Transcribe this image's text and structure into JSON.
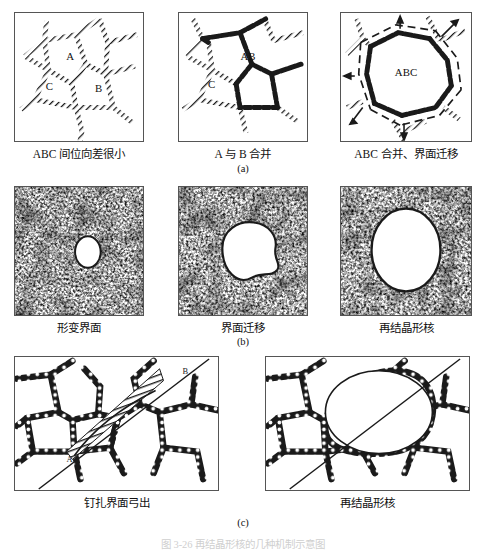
{
  "figure": {
    "bottom_caption": "图 3-26   再结晶形核的几种机制示意图",
    "rows": [
      {
        "id": "a",
        "row_label": "(a)",
        "mechanism": "亚晶合并形核",
        "panels": [
          {
            "caption": "ABC 间位向差很小",
            "grain_labels": [
              "A",
              "B",
              "C"
            ],
            "boundary_style": "hatched-thin",
            "description": "多边形亚晶网络，A、B、C 三个亚晶相邻"
          },
          {
            "caption": "A 与 B 合并",
            "grain_labels": [
              "AB",
              "C"
            ],
            "boundary_style": "hatched-thin-and-thick",
            "description": "A 与 B 之间亚晶界消失，合并为 AB，界面加粗"
          },
          {
            "caption": "ABC 合并、界面迁移",
            "grain_labels": [
              "ABC"
            ],
            "boundary_style": "thick-with-dashed-migration",
            "arrows": 5,
            "description": "ABC 合并为大晶粒，虚线表示迁移后界面位置，箭头表示迁移方向"
          }
        ]
      },
      {
        "id": "b",
        "row_label": "(b)",
        "mechanism": "变形基体中界面迁移形核",
        "panels": [
          {
            "caption": "形变界面",
            "boundary_style": "deformed-matrix",
            "nucleus_size": "small",
            "description": "高密度位错形变组织，出现很小的无畸变区"
          },
          {
            "caption": "界面迁移",
            "boundary_style": "deformed-matrix",
            "nucleus_size": "medium",
            "description": "无畸变区长大，界面向形变基体迁移"
          },
          {
            "caption": "再结晶形核",
            "boundary_style": "deformed-matrix",
            "nucleus_size": "large",
            "description": "形成较大的再结晶晶核"
          }
        ]
      },
      {
        "id": "c",
        "row_label": "(c)",
        "mechanism": "钉扎界面弓出形核",
        "panels": [
          {
            "caption": "钉扎界面弓出",
            "grain_labels": [
              "A",
              "B"
            ],
            "boundary_style": "beaded-pinned",
            "description": "AB 间被质点钉扎的界面向一侧弓出，弓出区画有剖面线"
          },
          {
            "caption": "再结晶形核",
            "boundary_style": "beaded-pinned",
            "description": "弓出部分长大形成无畸变的再结晶晶核"
          }
        ]
      }
    ]
  },
  "colors": {
    "ink": "#1a1a1a",
    "panel_border": "#555555",
    "paper": "#ffffff",
    "faded_caption": "#cfcfcf"
  }
}
